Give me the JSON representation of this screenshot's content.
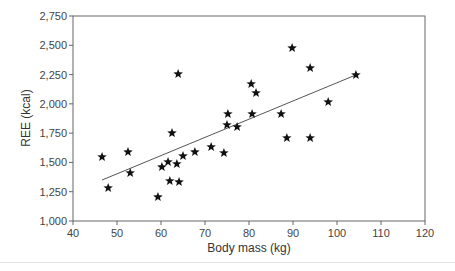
{
  "chart_data": {
    "type": "scatter",
    "title": "",
    "xlabel": "Body mass (kg)",
    "ylabel": "REE (kcal)",
    "xlim": [
      40,
      120
    ],
    "ylim": [
      1000,
      2750
    ],
    "xticks": [
      40,
      50,
      60,
      70,
      80,
      90,
      100,
      110,
      120
    ],
    "yticks": [
      1000,
      1250,
      1500,
      1750,
      2000,
      2250,
      2500,
      2750
    ],
    "xtick_labels": [
      "40",
      "50",
      "60",
      "70",
      "80",
      "90",
      "100",
      "110",
      "120"
    ],
    "ytick_labels": [
      "1,000",
      "1,250",
      "1,500",
      "1,750",
      "2,000",
      "2,250",
      "2,500",
      "2,750"
    ],
    "grid": false,
    "marker": "star",
    "marker_color": "#111111",
    "series": [
      {
        "name": "Subjects",
        "points": [
          [
            46.6,
            1547
          ],
          [
            48.0,
            1282
          ],
          [
            52.5,
            1589
          ],
          [
            53.0,
            1410
          ],
          [
            59.3,
            1205
          ],
          [
            60.2,
            1461
          ],
          [
            61.6,
            1504
          ],
          [
            62.0,
            1342
          ],
          [
            62.5,
            1751
          ],
          [
            63.6,
            1487
          ],
          [
            63.9,
            2255
          ],
          [
            64.1,
            1333
          ],
          [
            65.0,
            1555
          ],
          [
            67.7,
            1589
          ],
          [
            71.4,
            1632
          ],
          [
            74.3,
            1581
          ],
          [
            75.0,
            1820
          ],
          [
            75.2,
            1914
          ],
          [
            77.3,
            1803
          ],
          [
            80.5,
            2170
          ],
          [
            80.7,
            1914
          ],
          [
            81.6,
            2093
          ],
          [
            87.3,
            1914
          ],
          [
            88.6,
            1709
          ],
          [
            89.8,
            2477
          ],
          [
            93.9,
            2306
          ],
          [
            93.9,
            1709
          ],
          [
            98.0,
            2016
          ],
          [
            104.3,
            2247
          ]
        ]
      }
    ],
    "trendline": {
      "type": "linear",
      "x": [
        46.6,
        104.3
      ],
      "y": [
        1350,
        2247
      ],
      "color": "#555555"
    }
  }
}
